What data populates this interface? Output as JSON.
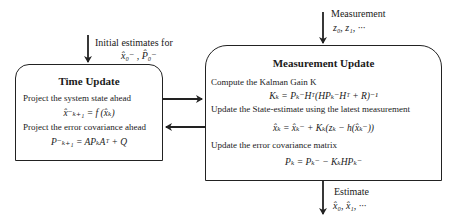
{
  "inputs": {
    "initial_label": "Initial estimates for",
    "initial_values": "x̂₀⁻ , P̂₀⁻",
    "measurement_label": "Measurement",
    "measurement_values": "z₀, z₁, ···"
  },
  "time_update": {
    "title": "Time Update",
    "step1": "Project the system state ahead",
    "eq1": "x̂⁻ₖ₊₁ = f (x̂ₖ)",
    "step2": "Project the error covariance ahead",
    "eq2": "P⁻ₖ₊₁ = APₖAᵀ + Q"
  },
  "measurement_update": {
    "title": "Measurement Update",
    "step1": "Compute the Kalman Gain K",
    "eq1": "Kₖ = Pₖ⁻Hᵀ(HPₖ⁻Hᵀ + R)⁻¹",
    "step2": "Update the State-estimate using the latest measurement",
    "eq2": "x̂ₖ = x̂ₖ⁻ + Kₖ(zₖ − h(x̂ₖ⁻))",
    "step3": "Update the error covariance matrix",
    "eq3": "Pₖ = Pₖ⁻ − KₖHPₖ⁻"
  },
  "output": {
    "label": "Estimate",
    "values": "x̂₀, x̂₁, ···"
  },
  "colors": {
    "line": "#222222",
    "text": "#1a1a1a",
    "background": "#ffffff"
  }
}
